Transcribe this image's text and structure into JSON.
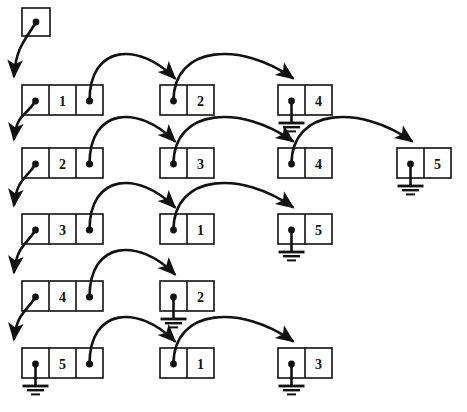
{
  "diagram": {
    "type": "linked-list",
    "width": 467,
    "height": 412,
    "stroke_color": "#111111",
    "background_color": "#ffffff",
    "head_pointer": {
      "label": "",
      "name": "head-pointer-box"
    },
    "rows": [
      {
        "index": 0,
        "name": "list-row-1",
        "nodes": [
          {
            "name": "node-1-1",
            "value": "1",
            "cells": 3,
            "ptr_cell": 0,
            "tail_ptr_cell": 2,
            "ground": false
          },
          {
            "name": "node-1-2",
            "value": "2",
            "cells": 2,
            "ptr_cell": 0,
            "tail_ptr_cell": 0,
            "ground": false
          },
          {
            "name": "node-1-3",
            "value": "4",
            "cells": 2,
            "ptr_cell": 0,
            "tail_ptr_cell": 0,
            "ground": true
          }
        ]
      },
      {
        "index": 1,
        "name": "list-row-2",
        "nodes": [
          {
            "name": "node-2-1",
            "value": "2",
            "cells": 3,
            "ptr_cell": 0,
            "tail_ptr_cell": 2,
            "ground": false
          },
          {
            "name": "node-2-2",
            "value": "3",
            "cells": 2,
            "ptr_cell": 0,
            "tail_ptr_cell": 0,
            "ground": false
          },
          {
            "name": "node-2-3",
            "value": "4",
            "cells": 2,
            "ptr_cell": 0,
            "tail_ptr_cell": 0,
            "ground": false
          },
          {
            "name": "node-2-4",
            "value": "5",
            "cells": 2,
            "ptr_cell": 0,
            "tail_ptr_cell": 0,
            "ground": true
          }
        ]
      },
      {
        "index": 2,
        "name": "list-row-3",
        "nodes": [
          {
            "name": "node-3-1",
            "value": "3",
            "cells": 3,
            "ptr_cell": 0,
            "tail_ptr_cell": 2,
            "ground": false
          },
          {
            "name": "node-3-2",
            "value": "1",
            "cells": 2,
            "ptr_cell": 0,
            "tail_ptr_cell": 0,
            "ground": false
          },
          {
            "name": "node-3-3",
            "value": "5",
            "cells": 2,
            "ptr_cell": 0,
            "tail_ptr_cell": 0,
            "ground": true
          }
        ]
      },
      {
        "index": 3,
        "name": "list-row-4",
        "nodes": [
          {
            "name": "node-4-1",
            "value": "4",
            "cells": 3,
            "ptr_cell": 0,
            "tail_ptr_cell": 2,
            "ground": false
          },
          {
            "name": "node-4-2",
            "value": "2",
            "cells": 2,
            "ptr_cell": 0,
            "tail_ptr_cell": 0,
            "ground": true
          }
        ]
      },
      {
        "index": 4,
        "name": "list-row-5",
        "nodes": [
          {
            "name": "node-5-1",
            "value": "5",
            "cells": 3,
            "ptr_cell": 0,
            "tail_ptr_cell": 2,
            "ground": true
          },
          {
            "name": "node-5-2",
            "value": "1",
            "cells": 2,
            "ptr_cell": 0,
            "tail_ptr_cell": 0,
            "ground": false
          },
          {
            "name": "node-5-3",
            "value": "3",
            "cells": 2,
            "ptr_cell": 0,
            "tail_ptr_cell": 0,
            "ground": true
          }
        ]
      }
    ]
  }
}
